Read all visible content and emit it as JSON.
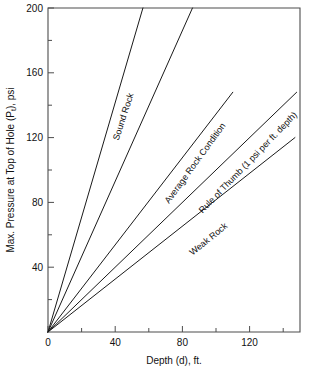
{
  "chart_data": {
    "type": "line",
    "title": "",
    "xlabel": "Depth (d), ft.",
    "ylabel_main": "Max. Pressure at Top of Hole (P",
    "ylabel_sub": "t",
    "ylabel_tail": "), psi",
    "ylabel_full": "Max. Pressure at Top of Hole (Pt), psi",
    "xlim": [
      0,
      150
    ],
    "ylim": [
      0,
      200
    ],
    "grid": false,
    "legend": "inline-labels",
    "x_ticks_major": [
      0,
      40,
      80,
      120
    ],
    "x_ticks_major_labels": [
      "0",
      "40",
      "80",
      "120"
    ],
    "x_ticks_minor": [
      20,
      60,
      100,
      140
    ],
    "y_ticks_major": [
      40,
      80,
      120,
      160,
      200
    ],
    "y_ticks_major_labels": [
      "40",
      "80",
      "120",
      "160",
      "200"
    ],
    "y_ticks_minor": [
      20,
      60,
      100,
      140,
      180
    ],
    "series": [
      {
        "name": "Sound Rock",
        "label": "Sound Rock",
        "slope_psi_per_ft": 3.55,
        "x": [
          0,
          56.5
        ],
        "y": [
          0,
          200
        ],
        "label_x": 42,
        "label_y": 118,
        "label_rotation": -72
      },
      {
        "name": "Second Rock Line",
        "label": "",
        "slope_psi_per_ft": 2.32,
        "x": [
          0,
          86.0
        ],
        "y": [
          0,
          200
        ],
        "label_x": null,
        "label_y": null,
        "label_rotation": 0
      },
      {
        "name": "Average Rock Condition",
        "label": "Average Rock Condition",
        "slope_psi_per_ft": 1.35,
        "x": [
          0,
          110.0
        ],
        "y": [
          0,
          148
        ],
        "label_x": 72,
        "label_y": 79,
        "label_rotation": -54
      },
      {
        "name": "Rule of Thumb",
        "label": "Rule of Thumb (1 psi per ft. depth)",
        "slope_psi_per_ft": 1.0,
        "x": [
          0,
          148.0
        ],
        "y": [
          0,
          148
        ],
        "label_x": 92,
        "label_y": 73,
        "label_rotation": -46
      },
      {
        "name": "Weak Rock",
        "label": "Weak Rock",
        "slope_psi_per_ft": 0.815,
        "x": [
          0,
          147.0
        ],
        "y": [
          0,
          120
        ],
        "label_x": 86,
        "label_y": 47,
        "label_rotation": -39
      }
    ],
    "colors": {
      "line": "#1a1a1a",
      "frame": "#4d4d4d",
      "text": "#111111",
      "background": "#ffffff"
    }
  }
}
